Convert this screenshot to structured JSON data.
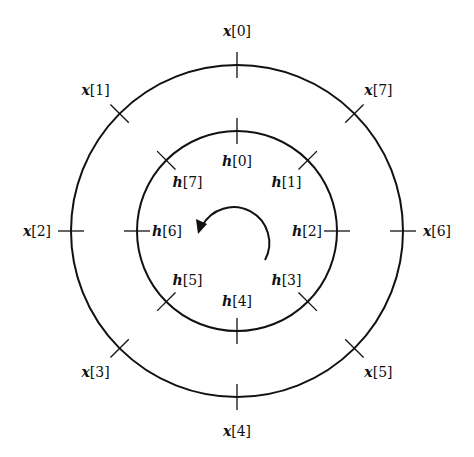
{
  "diagram": {
    "center": [
      237,
      231
    ],
    "outer_ring": {
      "radius": 166,
      "labels": [
        "x[0]",
        "x[1]",
        "x[2]",
        "x[3]",
        "x[4]",
        "x[5]",
        "x[6]",
        "x[7]"
      ]
    },
    "inner_ring": {
      "radius": 100,
      "labels": [
        "h[0]",
        "h[1]",
        "h[2]",
        "h[3]",
        "h[4]",
        "h[5]",
        "h[6]",
        "h[7]"
      ]
    },
    "outer_direction": "counterclockwise",
    "inner_direction": "clockwise",
    "rotation_arrow": {
      "direction": "counterclockwise",
      "radius": 32
    },
    "stroke_color": "#111111",
    "background": "#ffffff"
  }
}
